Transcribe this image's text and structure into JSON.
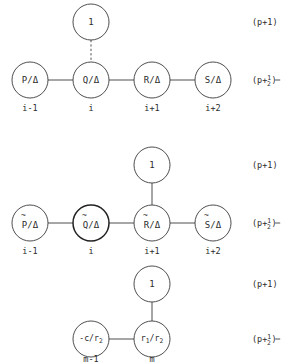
{
  "figure": {
    "name": "difference-stencil-diagram",
    "background_color": "#ffffff",
    "stroke_color": "#3a3a3a",
    "text_color": "#2b2b2b"
  },
  "level_labels": {
    "upper": "(p+1)",
    "lower_prefix": "(p+",
    "lower_numerator": "1",
    "lower_denominator": "2",
    "lower_suffix": ")"
  },
  "panels": [
    {
      "id": "panel-1",
      "top_node": {
        "label": "1"
      },
      "connector_style": "dashed",
      "connector_target_index": 1,
      "nodes": [
        {
          "label": "P/Δ",
          "base": "P",
          "accent": "",
          "index": "i-1",
          "emphasis": "normal"
        },
        {
          "label": "Q/Δ",
          "base": "Q",
          "accent": "",
          "index": "i",
          "emphasis": "normal"
        },
        {
          "label": "R/Δ",
          "base": "R",
          "accent": "",
          "index": "i+1",
          "emphasis": "normal"
        },
        {
          "label": "S/Δ",
          "base": "S",
          "accent": "",
          "index": "i+2",
          "emphasis": "normal"
        }
      ]
    },
    {
      "id": "panel-2",
      "top_node": {
        "label": "1"
      },
      "connector_style": "solid",
      "connector_target_index": 2,
      "nodes": [
        {
          "label": "P̃/Δ",
          "base": "P",
          "accent": "~",
          "index": "i-1",
          "emphasis": "normal"
        },
        {
          "label": "Q̃/Δ",
          "base": "Q",
          "accent": "~",
          "index": "i",
          "emphasis": "bold"
        },
        {
          "label": "R̃/Δ",
          "base": "R",
          "accent": "~",
          "index": "i+1",
          "emphasis": "normal"
        },
        {
          "label": "S̃/Δ",
          "base": "S",
          "accent": "~",
          "index": "i+2",
          "emphasis": "normal"
        }
      ]
    },
    {
      "id": "panel-3",
      "top_node": {
        "label": "1"
      },
      "connector_style": "solid",
      "connector_target_index": 1,
      "nodes": [
        {
          "label": "-c/r2",
          "numer": "-c",
          "denom": "r",
          "denom_sub": "2",
          "index": "m-1",
          "emphasis": "normal"
        },
        {
          "label": "r1/r2",
          "numer": "r",
          "numer_sub": "1",
          "denom": "r",
          "denom_sub": "2",
          "index": "m",
          "emphasis": "normal"
        }
      ]
    }
  ]
}
